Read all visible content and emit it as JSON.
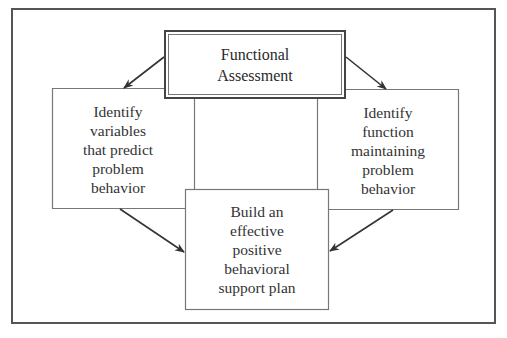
{
  "diagram": {
    "type": "flowchart",
    "nodes": {
      "top": {
        "id": "functional-assessment",
        "label": "Functional\nAssessment"
      },
      "left": {
        "id": "identify-variables",
        "label": "Identify\nvariables\nthat predict\nproblem\nbehavior"
      },
      "right": {
        "id": "identify-function",
        "label": "Identify\nfunction\nmaintaining\nproblem\nbehavior"
      },
      "bottom": {
        "id": "build-plan",
        "label": "Build an\neffective\npositive\nbehavioral\nsupport plan"
      }
    },
    "edges": [
      {
        "from": "functional-assessment",
        "to": "identify-variables"
      },
      {
        "from": "functional-assessment",
        "to": "identify-function"
      },
      {
        "from": "identify-variables",
        "to": "build-plan"
      },
      {
        "from": "identify-function",
        "to": "build-plan"
      }
    ],
    "colors": {
      "line": "#555555",
      "arrow": "#333333",
      "text": "#333333",
      "background": "#ffffff"
    }
  }
}
